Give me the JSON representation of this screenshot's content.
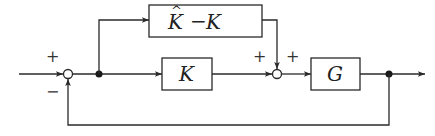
{
  "diagram": {
    "type": "block-diagram",
    "blocks": [
      {
        "id": "khat_minus_k",
        "label_main": "K",
        "label_hat": "^",
        "label_op": "−",
        "label_second": "K",
        "full_label": "K̂−K"
      },
      {
        "id": "k",
        "label": "K"
      },
      {
        "id": "g",
        "label": "G"
      }
    ],
    "summing_junctions": [
      {
        "id": "sum1",
        "signs": {
          "input": "+",
          "feedback": "−"
        }
      },
      {
        "id": "sum2",
        "signs": {
          "left": "+",
          "top": "+"
        }
      }
    ],
    "branch_points": [
      "after-sum1",
      "after-g"
    ],
    "colors": {
      "line": "#2a2a2a",
      "background": "#ffffff"
    }
  }
}
